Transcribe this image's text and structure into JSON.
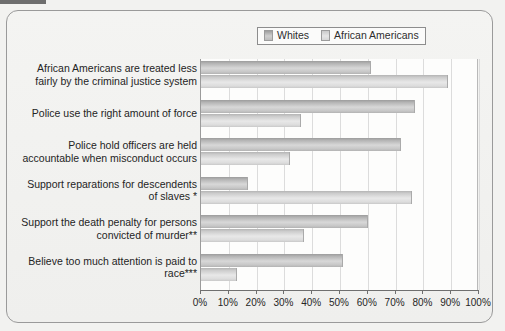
{
  "legend": {
    "items": [
      {
        "label": "Whites",
        "icon": "legend-swatch-icon",
        "color": "#bdbdbd"
      },
      {
        "label": "African Americans",
        "icon": "legend-swatch-icon",
        "color": "#dcdcdc"
      }
    ]
  },
  "axis": {
    "ticks": [
      "0%",
      "10%",
      "20%",
      "30%",
      "40%",
      "50%",
      "60%",
      "70%",
      "80%",
      "90%",
      "100%"
    ]
  },
  "chart_data": {
    "type": "bar",
    "orientation": "horizontal",
    "title": "",
    "subtitle": "",
    "xlabel": "",
    "ylabel": "",
    "xlim": [
      0,
      100
    ],
    "xtick_labels": [
      "0%",
      "10%",
      "20%",
      "30%",
      "40%",
      "50%",
      "60%",
      "70%",
      "80%",
      "90%",
      "100%"
    ],
    "xtick_values": [
      0,
      10,
      20,
      30,
      40,
      50,
      60,
      70,
      80,
      90,
      100
    ],
    "grid": true,
    "grid_axis": "x",
    "legend_position": "top-right",
    "categories": [
      "African Americans are treated less fairly by the criminal justice system",
      "Police use the right amount of force",
      "Police hold officers are held accountable when misconduct occurs",
      "Support reparations for descendents of slaves *",
      "Support the death penalty for persons convicted of murder**",
      "Believe too much attention is paid to race***"
    ],
    "category_lines": [
      [
        "African Americans are treated less",
        "fairly by the criminal justice system"
      ],
      [
        "Police use the right amount of force"
      ],
      [
        "Police hold officers are held",
        "accountable when misconduct occurs"
      ],
      [
        "Support reparations for descendents",
        "of slaves *"
      ],
      [
        "Support the death penalty for persons",
        "convicted of murder**"
      ],
      [
        "Believe too much attention is paid to",
        "race***"
      ]
    ],
    "series": [
      {
        "name": "Whites",
        "values": [
          61,
          77,
          72,
          17,
          60,
          51
        ]
      },
      {
        "name": "African Americans",
        "values": [
          89,
          36,
          32,
          76,
          37,
          13
        ]
      }
    ]
  }
}
